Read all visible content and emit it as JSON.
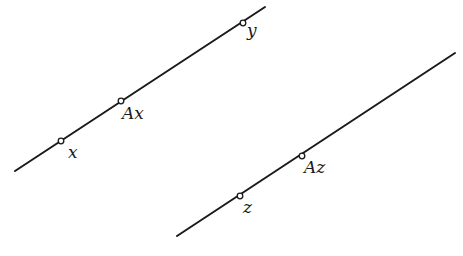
{
  "diagram": {
    "lines": [
      {
        "id": "line-1",
        "from": [
          15,
          171
        ],
        "to": [
          265,
          7
        ],
        "points": [
          {
            "label": "x",
            "at": [
              61,
              141
            ],
            "label_pos": [
              68,
              158
            ]
          },
          {
            "label": "Ax",
            "at": [
              121,
              101
            ],
            "label_pos": [
              123,
              118
            ]
          },
          {
            "label": "y",
            "at": [
              243,
              23
            ],
            "label_pos": [
              246,
              35
            ]
          }
        ]
      },
      {
        "id": "line-2",
        "from": [
          177,
          236
        ],
        "to": [
          455,
          53
        ],
        "points": [
          {
            "label": "z",
            "at": [
              240,
              196
            ],
            "label_pos": [
              243,
              212
            ]
          },
          {
            "label": "Az",
            "at": [
              302,
              156
            ],
            "label_pos": [
              305,
              172
            ]
          }
        ]
      }
    ],
    "colors": {
      "stroke": "#1a1a1a",
      "background": "#ffffff"
    }
  }
}
